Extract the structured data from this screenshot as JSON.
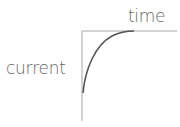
{
  "diagram": {
    "type": "current-vs-time charging curve",
    "labels": {
      "x_axis": "time",
      "y_axis": "current"
    },
    "colors": {
      "axis": "#a8a8a8",
      "curve": "#555555",
      "text": "#666666"
    },
    "curve": {
      "shape": "exponential rise to plateau",
      "start": [
        83,
        93
      ],
      "end": [
        133,
        31
      ]
    }
  }
}
